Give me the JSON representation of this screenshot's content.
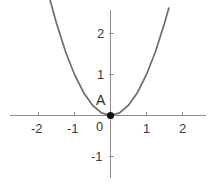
{
  "chart_data": {
    "type": "line",
    "title": "",
    "subtitle": "",
    "xlabel": "",
    "ylabel": "",
    "grid": false,
    "legend": "none",
    "function": "y = x^2",
    "xlim": [
      -2.45,
      2.45
    ],
    "ylim": [
      -1.45,
      2.75
    ],
    "xticks": [
      -2,
      -1,
      0,
      1,
      2
    ],
    "yticks": [
      -1,
      1,
      2
    ],
    "xtick_labels": [
      "-2",
      "-1",
      "0",
      "1",
      "2"
    ],
    "ytick_labels": [
      "-1",
      "1",
      "2"
    ],
    "x": [
      -1.68,
      -1.5,
      -1.25,
      -1.0,
      -0.75,
      -0.5,
      -0.25,
      0,
      0.25,
      0.5,
      0.75,
      1.0,
      1.25,
      1.5,
      1.62
    ],
    "values": [
      2.82,
      2.25,
      1.5625,
      1.0,
      0.5625,
      0.25,
      0.0625,
      0,
      0.0625,
      0.25,
      0.5625,
      1.0,
      1.5625,
      2.25,
      2.62
    ],
    "points": [
      {
        "label": "A",
        "x": 0,
        "y": 0,
        "marker": "filled-circle",
        "color": "#000000"
      }
    ],
    "curve_color": "#6e6e6e",
    "axis_color": "#8c8c8c",
    "text_color": "#3b3b3b",
    "background_color": "#ffffff"
  },
  "axes": {
    "x_axis_name": "x-axis",
    "y_axis_name": "y-axis",
    "origin_label": "0"
  }
}
